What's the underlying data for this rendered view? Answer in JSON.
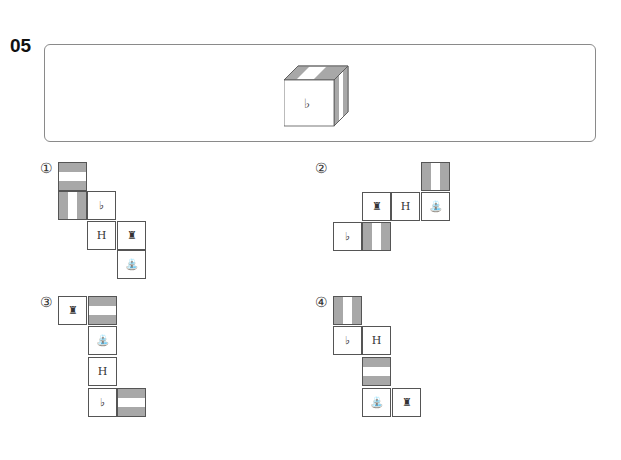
{
  "question_number": "05",
  "cube": {
    "front_symbol": "♭"
  },
  "options": [
    {
      "label": "①",
      "cells": [
        {
          "x": 58,
          "y": 162,
          "type": "hstripe",
          "symbol": ""
        },
        {
          "x": 58,
          "y": 191,
          "type": "vstripe",
          "symbol": ""
        },
        {
          "x": 87,
          "y": 191,
          "type": "symbol",
          "symbol": "♭"
        },
        {
          "x": 87,
          "y": 221,
          "type": "symbol",
          "symbol": "H"
        },
        {
          "x": 117,
          "y": 221,
          "type": "symbol",
          "symbol": "♜"
        },
        {
          "x": 117,
          "y": 250,
          "type": "symbol",
          "symbol": "⛲"
        }
      ]
    },
    {
      "label": "②",
      "cells": [
        {
          "x": 421,
          "y": 162,
          "type": "vstripe",
          "symbol": ""
        },
        {
          "x": 362,
          "y": 192,
          "type": "symbol",
          "symbol": "♜"
        },
        {
          "x": 391,
          "y": 192,
          "type": "symbol",
          "symbol": "H"
        },
        {
          "x": 421,
          "y": 192,
          "type": "symbol",
          "symbol": "⛲"
        },
        {
          "x": 333,
          "y": 222,
          "type": "symbol",
          "symbol": "♭"
        },
        {
          "x": 362,
          "y": 222,
          "type": "vstripe",
          "symbol": ""
        }
      ]
    },
    {
      "label": "③",
      "cells": [
        {
          "x": 58,
          "y": 296,
          "type": "symbol",
          "symbol": "♜"
        },
        {
          "x": 88,
          "y": 296,
          "type": "hstripe",
          "symbol": ""
        },
        {
          "x": 88,
          "y": 326,
          "type": "symbol",
          "symbol": "⛲"
        },
        {
          "x": 88,
          "y": 357,
          "type": "symbol",
          "symbol": "H"
        },
        {
          "x": 88,
          "y": 388,
          "type": "symbol",
          "symbol": "♭"
        },
        {
          "x": 117,
          "y": 388,
          "type": "hstripe",
          "symbol": ""
        }
      ]
    },
    {
      "label": "④",
      "cells": [
        {
          "x": 333,
          "y": 296,
          "type": "vstripe",
          "symbol": ""
        },
        {
          "x": 333,
          "y": 326,
          "type": "symbol",
          "symbol": "♭"
        },
        {
          "x": 362,
          "y": 326,
          "type": "symbol",
          "symbol": "H"
        },
        {
          "x": 362,
          "y": 357,
          "type": "hstripe",
          "symbol": ""
        },
        {
          "x": 362,
          "y": 388,
          "type": "symbol",
          "symbol": "⛲"
        },
        {
          "x": 392,
          "y": 388,
          "type": "symbol",
          "symbol": "♜"
        }
      ]
    }
  ],
  "label_positions": [
    {
      "x": 40,
      "y": 160
    },
    {
      "x": 315,
      "y": 160
    },
    {
      "x": 40,
      "y": 294
    },
    {
      "x": 315,
      "y": 294
    }
  ]
}
